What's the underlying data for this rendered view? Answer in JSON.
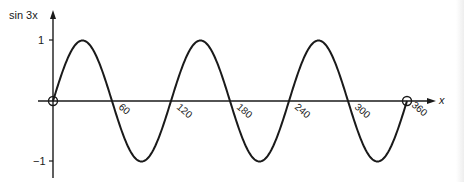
{
  "chart_data": {
    "type": "line",
    "title": "",
    "function": "sin 3x",
    "xlabel": "x",
    "ylabel": "sin 3x",
    "x_unit": "degrees",
    "xlim": [
      0,
      360
    ],
    "ylim": [
      -1,
      1
    ],
    "grid": false,
    "legend": null,
    "x_ticks": [
      60,
      120,
      180,
      240,
      300,
      360
    ],
    "x_tick_labels": [
      "60",
      "120",
      "180",
      "240",
      "300",
      "360"
    ],
    "y_ticks": [
      1,
      -1
    ],
    "y_tick_labels": [
      "1",
      "−1"
    ],
    "marked_points": [
      {
        "x": 0,
        "y": 0,
        "style": "open-circle"
      },
      {
        "x": 360,
        "y": 0,
        "style": "open-circle"
      }
    ],
    "series": [
      {
        "name": "sin 3x",
        "x": [
          0,
          30,
          60,
          90,
          120,
          150,
          180,
          210,
          240,
          270,
          300,
          330,
          360
        ],
        "values": [
          0,
          1,
          0,
          -1,
          0,
          1,
          0,
          -1,
          0,
          1,
          0,
          -1,
          0
        ]
      }
    ]
  },
  "labels": {
    "y_axis": "sin 3x",
    "x_axis": "x",
    "y_tick_pos": "1",
    "y_tick_neg": "−1",
    "x_ticks": [
      "60",
      "120",
      "180",
      "240",
      "300",
      "360"
    ]
  },
  "colors": {
    "ink": "#1a1a1a",
    "background": "#ffffff"
  }
}
